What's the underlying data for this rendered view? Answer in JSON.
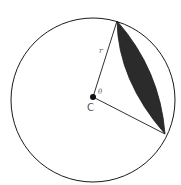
{
  "diagram": {
    "labels": {
      "radius": "r",
      "angle": "θ",
      "center": "C"
    },
    "geometry": {
      "circle": {
        "cx": 93,
        "cy": 100,
        "r": 82
      },
      "center_point": {
        "x": 93,
        "y": 97
      },
      "chord_endpoints": [
        {
          "x": 117,
          "y": 21
        },
        {
          "x": 165,
          "y": 134
        }
      ]
    },
    "colors": {
      "stroke": "#1a1a1a",
      "segment_fill": "#2b2b2b",
      "label": "#666666"
    }
  }
}
